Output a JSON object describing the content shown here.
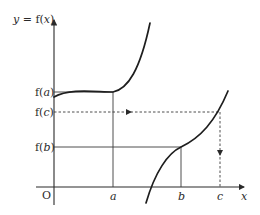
{
  "diagram": {
    "y_axis_label": "y = f(x)",
    "x_axis_label": "x",
    "origin_label": "O",
    "x_ticks": [
      {
        "id": "a",
        "label": "a"
      },
      {
        "id": "b",
        "label": "b"
      },
      {
        "id": "c",
        "label": "c"
      }
    ],
    "y_ticks": [
      {
        "id": "fa",
        "label": "f(a)"
      },
      {
        "id": "fc",
        "label": "f(c)"
      },
      {
        "id": "fb",
        "label": "f(b)"
      }
    ],
    "curves": [
      {
        "id": "left-branch",
        "description": "increasing cubic-like branch passing through (a, f(a))"
      },
      {
        "id": "right-branch",
        "description": "increasing cubic-like branch passing through (b, f(b)) and (c, f(c))"
      }
    ],
    "guides": [
      {
        "id": "fa-horizontal",
        "style": "solid"
      },
      {
        "id": "a-vertical",
        "style": "solid"
      },
      {
        "id": "fb-horizontal",
        "style": "solid"
      },
      {
        "id": "b-vertical",
        "style": "solid"
      },
      {
        "id": "fc-horizontal",
        "style": "dashed",
        "arrow": "right"
      },
      {
        "id": "c-vertical",
        "style": "dashed",
        "arrow": "down"
      }
    ],
    "colors": {
      "ink": "#2a2a2a",
      "background": "#ffffff"
    }
  }
}
